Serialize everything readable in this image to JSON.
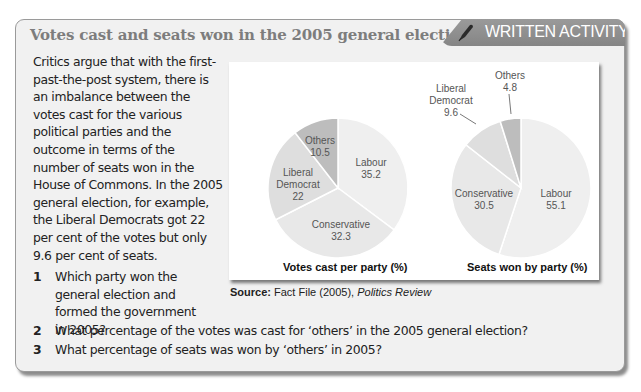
{
  "header": {
    "title": "Votes cast and seats won in the 2005 general election",
    "tag_label": "WRITTEN ACTIVITY",
    "tag_icon": "pen-icon"
  },
  "intro": {
    "text": "Critics argue that with the first-past-the-post system, there is an imbalance between the votes cast for the various political parties and the outcome in terms of the number of seats won in the House of Commons. In the 2005 general election, for example, the Liberal Democrats got 22 per cent of the votes but only 9.6 per cent of seats."
  },
  "charts": {
    "votes_caption": "Votes cast per party (%)",
    "seats_caption": "Seats won by party (%)",
    "source_label": "Source:",
    "source_text": " Fact File (2005), ",
    "source_italic": "Politics Review"
  },
  "questions": [
    {
      "num": "1",
      "text": "Which party won the general election and formed the government in 2005?"
    },
    {
      "num": "2",
      "text": "What percentage of the votes was cast for ‘others’ in the 2005 general election?"
    },
    {
      "num": "3",
      "text": "What percentage of seats was won by ‘others’ in 2005?"
    }
  ],
  "chart_data": [
    {
      "type": "pie",
      "title": "Votes cast per party (%)",
      "categories": [
        "Labour",
        "Conservative",
        "Liberal Democrat",
        "Others"
      ],
      "values": [
        35.2,
        32.3,
        22,
        10.5
      ],
      "colors": [
        "#efefef",
        "#e8e8e8",
        "#dedede",
        "#bdbdbd"
      ]
    },
    {
      "type": "pie",
      "title": "Seats won by party (%)",
      "categories": [
        "Labour",
        "Conservative",
        "Liberal Democrat",
        "Others"
      ],
      "values": [
        55.1,
        30.5,
        9.6,
        4.8
      ],
      "colors": [
        "#efefef",
        "#e8e8e8",
        "#dedede",
        "#bdbdbd"
      ]
    }
  ]
}
